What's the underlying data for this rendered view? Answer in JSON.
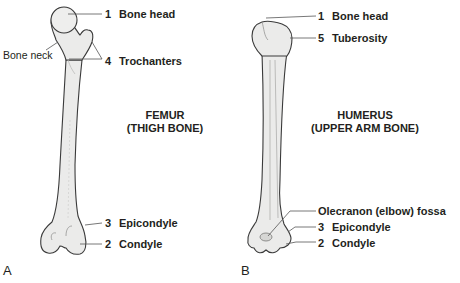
{
  "panels": [
    {
      "letter": "A",
      "title_line1": "FEMUR",
      "title_line2": "(THIGH BONE)",
      "labels": [
        {
          "num": "1",
          "text": "Bone head"
        },
        {
          "num": "4",
          "text": "Trochanters"
        },
        {
          "num": "3",
          "text": "Epicondyle"
        },
        {
          "num": "2",
          "text": "Condyle"
        }
      ],
      "unnumbered_labels": [
        {
          "text": "Bone neck"
        }
      ]
    },
    {
      "letter": "B",
      "title_line1": "HUMERUS",
      "title_line2": "(UPPER ARM BONE)",
      "labels": [
        {
          "num": "1",
          "text": "Bone head"
        },
        {
          "num": "5",
          "text": "Tuberosity"
        },
        {
          "num": "3",
          "text": "Epicondyle"
        },
        {
          "num": "2",
          "text": "Condyle"
        }
      ],
      "unnumbered_labels": [
        {
          "text": "Olecranon (elbow) fossa"
        }
      ]
    }
  ],
  "colors": {
    "bone_fill": "#ebebea",
    "bone_shade": "#d6d6d4",
    "outline": "#3a3a3a",
    "leader": "#555555",
    "text": "#231f20"
  }
}
